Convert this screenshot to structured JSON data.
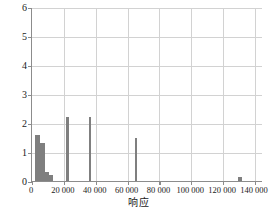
{
  "chart_data": {
    "type": "bar",
    "title": "",
    "subtitle": "",
    "xlabel": "响应",
    "ylabel": "残差平方",
    "xlim": [
      0,
      145000
    ],
    "ylim": [
      0,
      6
    ],
    "grid": true,
    "legend": null,
    "xticks": [
      0,
      20000,
      40000,
      60000,
      80000,
      100000,
      120000,
      140000
    ],
    "xtick_labels": [
      "0",
      "20 000",
      "40 000",
      "60 000",
      "80 000",
      "100 000",
      "120 000",
      "140 000"
    ],
    "yticks": [
      0,
      1,
      2,
      3,
      4,
      5,
      6
    ],
    "ytick_labels": [
      "0",
      "1",
      "2",
      "3",
      "4",
      "5",
      "6"
    ],
    "bar_color": "#7f7f7f",
    "bars": [
      {
        "x": 1700,
        "width": 3300,
        "value": 1.6
      },
      {
        "x": 5000,
        "width": 3300,
        "value": 1.3
      },
      {
        "x": 8300,
        "width": 2300,
        "value": 0.3
      },
      {
        "x": 10600,
        "width": 2300,
        "value": 0.2
      },
      {
        "x": 21500,
        "width": 1700,
        "value": 2.2
      },
      {
        "x": 35500,
        "width": 1700,
        "value": 2.2
      },
      {
        "x": 64500,
        "width": 1700,
        "value": 1.5
      },
      {
        "x": 129500,
        "width": 2300,
        "value": 0.15
      }
    ]
  }
}
